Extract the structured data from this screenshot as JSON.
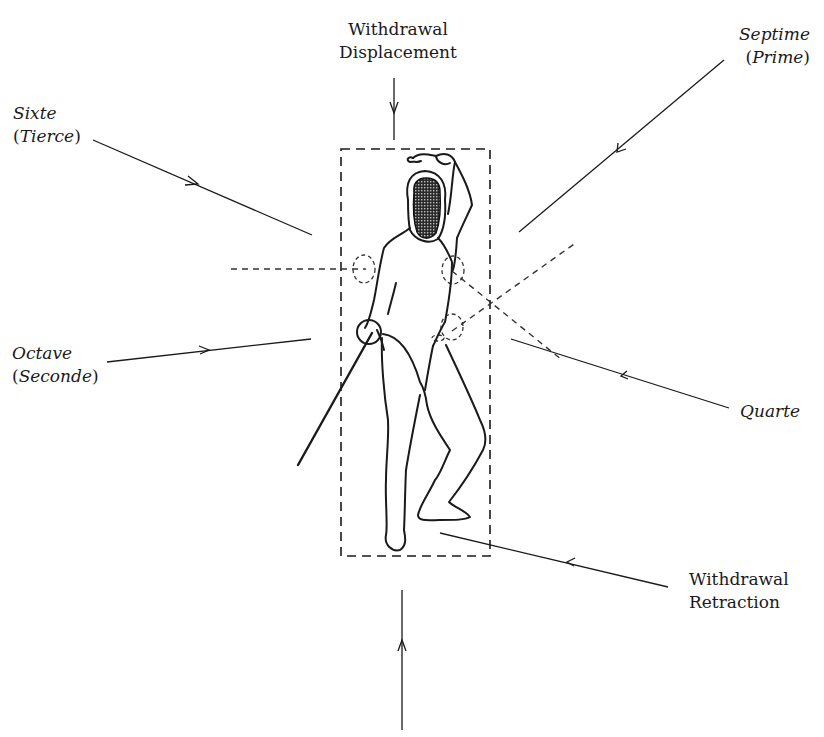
{
  "diagram": {
    "colors": {
      "ink": "#1a1a1a",
      "background": "#ffffff"
    },
    "labels": {
      "withdrawal_displacement": {
        "line1": "Withdrawal",
        "line2": "Displacement"
      },
      "sixte": {
        "line1": "Sixte",
        "open": "(",
        "inner": "Tierce",
        "close": ")"
      },
      "septime": {
        "line1": "Septime",
        "open": "(",
        "inner": "Prime",
        "close": ")"
      },
      "octave": {
        "line1": "Octave",
        "open": "(",
        "inner": "Seconde",
        "close": ")"
      },
      "quarte": {
        "line1": "Quarte"
      },
      "withdrawal_retraction": {
        "line1": "Withdrawal",
        "line2": "Retraction"
      }
    },
    "elements": {
      "target_box": "dashed-rectangle",
      "figure": "fencer-en-garde",
      "target_circles": 4,
      "arrows": [
        "withdrawal-displacement",
        "sixte",
        "septime",
        "octave",
        "quarte",
        "withdrawal-retraction",
        "bottom-vertical"
      ]
    }
  }
}
